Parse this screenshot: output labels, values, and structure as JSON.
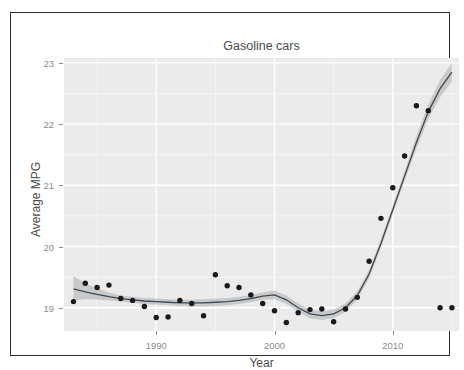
{
  "figure": {
    "top_clipped_text": "",
    "frame_color": "#2c2c2c",
    "background": "#ffffff"
  },
  "chart_data": {
    "type": "scatter",
    "title": "Gasoline cars",
    "xlabel": "Year",
    "ylabel": "Average MPG",
    "xlim": [
      1982.2,
      2015.6
    ],
    "ylim": [
      18.62,
      23.08
    ],
    "xticks": [
      1990,
      2000,
      2010
    ],
    "yticks": [
      19,
      20,
      21,
      22,
      23
    ],
    "grid": true,
    "grid_major_color": "#ffffff",
    "grid_minor_color": "#f5f5f5",
    "panel_background": "#ebebeb",
    "legend": "none",
    "point_color": "#1a1a1a",
    "point_size_px": 3.2,
    "smooth_line_color": "#3b4a56",
    "smooth_band_color": "#9a9a9a",
    "smooth_band_opacity": 0.42,
    "series": [
      {
        "name": "Average MPG",
        "x": [
          1983,
          1984,
          1985,
          1986,
          1987,
          1988,
          1989,
          1990,
          1991,
          1992,
          1993,
          1994,
          1995,
          1996,
          1997,
          1998,
          1999,
          2000,
          2001,
          2002,
          2003,
          2004,
          2005,
          2006,
          2007,
          2008,
          2009,
          2010,
          2011,
          2012,
          2013,
          2014,
          2015
        ],
        "y": [
          19.1,
          19.4,
          19.33,
          19.37,
          19.15,
          19.12,
          19.02,
          18.84,
          18.85,
          19.12,
          19.07,
          18.87,
          19.54,
          19.36,
          19.33,
          19.21,
          19.07,
          18.95,
          18.76,
          18.92,
          18.97,
          18.98,
          18.77,
          18.98,
          19.17,
          19.76,
          20.46,
          20.96,
          21.48,
          22.3,
          22.22,
          19.0,
          19.0
        ]
      }
    ],
    "smooth_curve": {
      "method": "loess",
      "x": [
        1983,
        1984,
        1985,
        1986,
        1987,
        1988,
        1989,
        1990,
        1991,
        1992,
        1993,
        1994,
        1995,
        1996,
        1997,
        1998,
        1999,
        2000,
        2001,
        2002,
        2003,
        2004,
        2005,
        2006,
        2007,
        2008,
        2009,
        2010,
        2011,
        2012,
        2013,
        2014,
        2015
      ],
      "y": [
        19.31,
        19.26,
        19.22,
        19.18,
        19.15,
        19.13,
        19.11,
        19.1,
        19.09,
        19.08,
        19.08,
        19.08,
        19.09,
        19.1,
        19.12,
        19.15,
        19.19,
        19.21,
        19.13,
        19.0,
        18.9,
        18.87,
        18.9,
        19.0,
        19.2,
        19.55,
        20.05,
        20.6,
        21.15,
        21.7,
        22.2,
        22.58,
        22.85
      ],
      "ymin": [
        19.12,
        19.14,
        19.13,
        19.12,
        19.1,
        19.08,
        19.06,
        19.05,
        19.04,
        19.03,
        19.02,
        19.02,
        19.03,
        19.04,
        19.06,
        19.09,
        19.13,
        19.14,
        19.06,
        18.93,
        18.83,
        18.8,
        18.83,
        18.93,
        19.13,
        19.48,
        19.98,
        20.53,
        21.07,
        21.6,
        22.08,
        22.44,
        22.7
      ],
      "ymax": [
        19.52,
        19.4,
        19.32,
        19.25,
        19.2,
        19.18,
        19.16,
        19.15,
        19.14,
        19.13,
        19.13,
        19.14,
        19.15,
        19.16,
        19.18,
        19.21,
        19.25,
        19.28,
        19.2,
        19.07,
        18.97,
        18.94,
        18.97,
        19.07,
        19.27,
        19.62,
        20.12,
        20.67,
        21.23,
        21.8,
        22.32,
        22.72,
        23.0
      ]
    }
  }
}
